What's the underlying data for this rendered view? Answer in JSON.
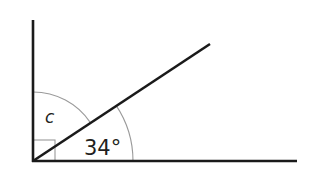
{
  "diagram": {
    "type": "angle-diagram",
    "labels": {
      "unknown_angle": "c",
      "known_angle": "34°"
    },
    "angles": {
      "right_angle_degrees": 90,
      "known_angle_degrees": 34
    },
    "colors": {
      "line": "#1a1a1a",
      "arc": "#9a9a9a",
      "text": "#231f20",
      "background": "#ffffff"
    }
  }
}
